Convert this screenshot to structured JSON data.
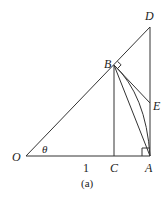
{
  "figure": {
    "caption": "(a)",
    "stroke_color": "#333333",
    "points": {
      "O": {
        "label": "O",
        "x": 26,
        "y": 156
      },
      "A": {
        "label": "A",
        "x": 150,
        "y": 156
      },
      "B": {
        "label": "B",
        "x": 114,
        "y": 65
      },
      "C": {
        "label": "C",
        "x": 114,
        "y": 156
      },
      "D": {
        "label": "D",
        "x": 150,
        "y": 27
      },
      "E": {
        "label": "E",
        "x": 150,
        "y": 103
      }
    },
    "angle_label": "θ",
    "segment_label": "1"
  }
}
